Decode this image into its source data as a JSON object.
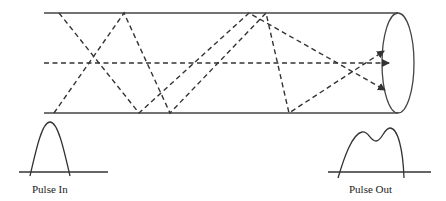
{
  "diagram": {
    "colors": {
      "stroke": "#333333",
      "background": "#ffffff"
    },
    "fiber": {
      "top_y": 13,
      "bottom_y": 113,
      "axis_y": 63,
      "left_x": 44,
      "end_cx": 398,
      "end_rx": 16,
      "end_ry": 50
    },
    "rays": [
      {
        "name": "axial-ray",
        "points": [
          [
            44,
            63
          ],
          [
            388,
            63
          ]
        ]
      },
      {
        "name": "ray-a",
        "points": [
          [
            59,
            13
          ],
          [
            139,
            113
          ],
          [
            249,
            13
          ],
          [
            384,
            90
          ]
        ]
      },
      {
        "name": "ray-b",
        "points": [
          [
            54,
            113
          ],
          [
            124,
            13
          ],
          [
            170,
            113
          ],
          [
            266,
            13
          ],
          [
            289,
            113
          ],
          [
            384,
            52
          ]
        ]
      }
    ],
    "pulses": [
      {
        "label": "Pulse In",
        "shape": "single-peak"
      },
      {
        "label": "Pulse Out",
        "shape": "double-peak"
      }
    ]
  }
}
